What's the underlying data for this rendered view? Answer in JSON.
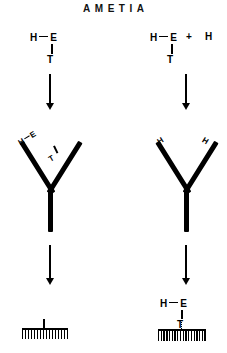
{
  "title": "AMETIA",
  "colors": {
    "ink": "#000000",
    "background": "#ffffff"
  },
  "diagram": {
    "type": "reaction-scheme",
    "columns": 2,
    "rows": 4
  },
  "left_column": {
    "step1": {
      "molecule": {
        "atom_top_left": "H",
        "atom_top_right": "E",
        "atom_bottom": "T",
        "bond_horizontal": "single-bond",
        "bond_vertical": "single-bond"
      }
    },
    "step2": {
      "arrow": "down-arrow"
    },
    "step3": {
      "shape": "y-antibody",
      "left_arm_label": {
        "atom_a": "H",
        "atom_b": "E",
        "sub_atom": "T"
      },
      "right_arm_label": ""
    },
    "step4": {
      "arrow": "down-arrow"
    },
    "step5": {
      "surface": "hatched-surface",
      "teeth_count": 16,
      "stem": "attachment-stem"
    }
  },
  "right_column": {
    "step1": {
      "molecule": {
        "atom_top_left": "H",
        "atom_top_right": "E",
        "atom_bottom": "T",
        "bond_horizontal": "single-bond",
        "bond_vertical": "single-bond"
      },
      "plus": "+",
      "lone_atom": "H"
    },
    "step2": {
      "arrow": "down-arrow"
    },
    "step3": {
      "shape": "y-antibody",
      "left_arm_label": "H",
      "right_arm_label": "H"
    },
    "step4": {
      "arrow": "down-arrow"
    },
    "step5": {
      "molecule": {
        "atom_top_left": "H",
        "atom_top_right": "E",
        "atom_bottom": "T"
      },
      "surface": "hatched-surface",
      "teeth_count": 18,
      "link": "dotted-link"
    }
  }
}
